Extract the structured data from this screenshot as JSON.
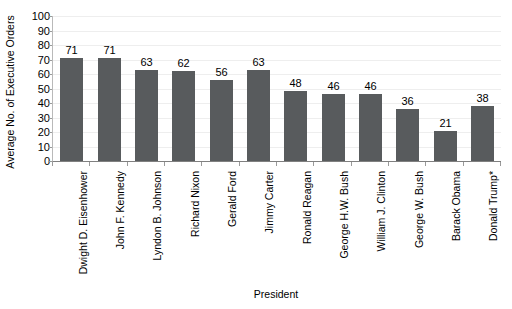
{
  "chart_data": {
    "type": "bar",
    "title": "",
    "subtitle": "",
    "xlabel": "President",
    "ylabel": "Average No. of Executive Orders",
    "categories": [
      "Dwight D. Eisenhower",
      "John F. Kennedy",
      "Lyndon B. Johnson",
      "Richard Nixon",
      "Gerald Ford",
      "Jimmy Carter",
      "Ronald Reagan",
      "George H.W. Bush",
      "William J. Clinton",
      "George W. Bush",
      "Barack Obama",
      "Donald Trump*"
    ],
    "values": [
      71,
      71,
      63,
      62,
      56,
      63,
      48,
      46,
      46,
      36,
      21,
      38
    ],
    "ylim": [
      0,
      100
    ],
    "ytick_labels": [
      "100",
      "90",
      "80",
      "70",
      "60",
      "50",
      "40",
      "30",
      "20",
      "10",
      "0"
    ],
    "ytick_values": [
      100,
      90,
      80,
      70,
      60,
      50,
      40,
      30,
      20,
      10,
      0
    ],
    "grid": true,
    "grid_axis": "y",
    "legend": false,
    "legend_position": "none",
    "data_labels": true,
    "bar_color": "#585b5d",
    "background_color": "#ffffff",
    "axis_color": "#808080",
    "gridline_color": "#eeeeee",
    "xtick_label_rotation": 90
  }
}
